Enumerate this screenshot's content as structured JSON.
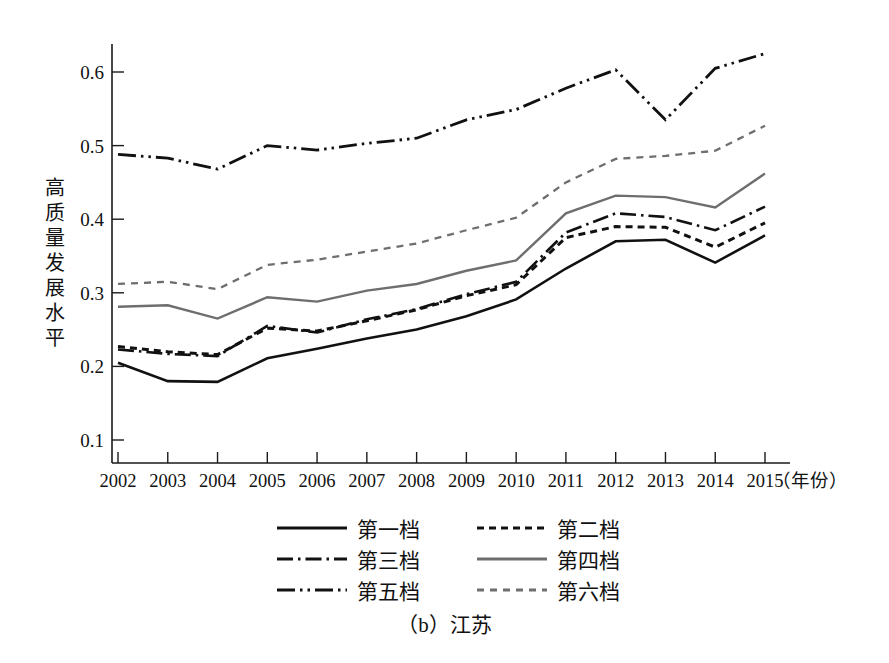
{
  "caption": "（b）江苏",
  "axis": {
    "y_title_chars": [
      "高",
      "质",
      "量",
      "发",
      "展",
      "水",
      "平"
    ],
    "y_title": "高质量发展水平",
    "x_unit_label": "（年份）"
  },
  "legend": {
    "rows": [
      [
        {
          "label": "第一档",
          "style": "solid",
          "color": "#111111"
        },
        {
          "label": "第二档",
          "style": "dotted-thick",
          "color": "#111111"
        }
      ],
      [
        {
          "label": "第三档",
          "style": "dash-dot",
          "color": "#111111"
        },
        {
          "label": "第四档",
          "style": "solid-gray",
          "color": "#6e6e6e"
        }
      ],
      [
        {
          "label": "第五档",
          "style": "dash-dot-dot",
          "color": "#111111"
        },
        {
          "label": "第六档",
          "style": "dashed-gray",
          "color": "#6e6e6e"
        }
      ]
    ]
  },
  "chart_data": {
    "type": "line",
    "title": "（b）江苏",
    "xlabel": "（年份）",
    "ylabel": "高质量发展水平",
    "x": [
      2002,
      2003,
      2004,
      2005,
      2006,
      2007,
      2008,
      2009,
      2010,
      2011,
      2012,
      2013,
      2014,
      2015
    ],
    "xtick_labels": [
      "2002",
      "2003",
      "2004",
      "2005",
      "2006",
      "2007",
      "2008",
      "2009",
      "2010",
      "2011",
      "2012",
      "2013",
      "2014",
      "2015"
    ],
    "ytick_labels": [
      "0.1",
      "0.2",
      "0.3",
      "0.4",
      "0.5",
      "0.6"
    ],
    "yticks": [
      0.1,
      0.2,
      0.3,
      0.4,
      0.5,
      0.6
    ],
    "ylim": [
      0.068,
      0.648
    ],
    "xlim": [
      2002,
      2015
    ],
    "grid": false,
    "legend_position": "below-axes",
    "series": [
      {
        "name": "第一档",
        "style": "solid",
        "color": "#111111",
        "width": 2.6,
        "values": [
          0.205,
          0.18,
          0.179,
          0.211,
          0.224,
          0.238,
          0.25,
          0.268,
          0.291,
          0.333,
          0.37,
          0.372,
          0.341,
          0.378
        ]
      },
      {
        "name": "第二档",
        "style": "dotted-thick",
        "color": "#111111",
        "width": 3.0,
        "values": [
          0.227,
          0.22,
          0.216,
          0.252,
          0.248,
          0.262,
          0.277,
          0.296,
          0.311,
          0.375,
          0.39,
          0.389,
          0.362,
          0.395
        ]
      },
      {
        "name": "第三档",
        "style": "dash-dot",
        "color": "#111111",
        "width": 2.6,
        "values": [
          0.223,
          0.217,
          0.214,
          0.255,
          0.246,
          0.264,
          0.278,
          0.298,
          0.315,
          0.382,
          0.408,
          0.403,
          0.385,
          0.417
        ]
      },
      {
        "name": "第四档",
        "style": "solid-gray",
        "color": "#6e6e6e",
        "width": 2.4,
        "values": [
          0.281,
          0.283,
          0.265,
          0.294,
          0.288,
          0.303,
          0.312,
          0.33,
          0.344,
          0.408,
          0.432,
          0.43,
          0.416,
          0.462
        ]
      },
      {
        "name": "第五档",
        "style": "dash-dot-dot",
        "color": "#111111",
        "width": 2.8,
        "values": [
          0.488,
          0.483,
          0.468,
          0.5,
          0.494,
          0.503,
          0.51,
          0.535,
          0.549,
          0.578,
          0.603,
          0.535,
          0.605,
          0.625
        ]
      },
      {
        "name": "第六档",
        "style": "dashed-gray",
        "color": "#6e6e6e",
        "width": 2.3,
        "values": [
          0.312,
          0.315,
          0.305,
          0.338,
          0.345,
          0.356,
          0.367,
          0.385,
          0.402,
          0.45,
          0.482,
          0.486,
          0.493,
          0.527
        ]
      }
    ]
  }
}
